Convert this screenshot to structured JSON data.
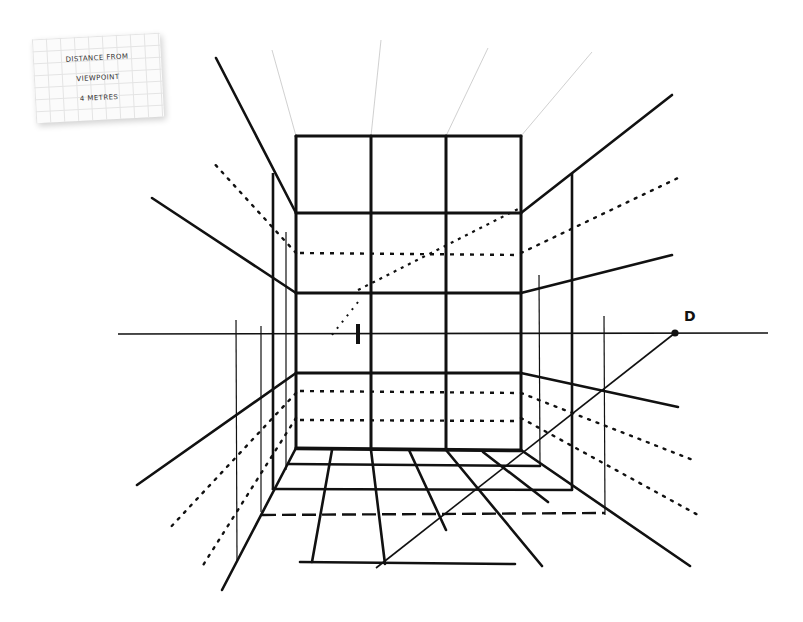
{
  "note_card": {
    "lines": [
      "DISTANCE FROM",
      "VIEWPOINT",
      "4 METRES"
    ]
  },
  "labels": {
    "distance_point": "D"
  },
  "drawing": {
    "type": "one-point perspective room grid",
    "horizon_y": 334,
    "vanishing_point": [
      358,
      335
    ],
    "distance_point": [
      675,
      333
    ],
    "back_wall": {
      "x": [
        296,
        371,
        446,
        521
      ],
      "y": [
        136,
        213,
        293,
        373,
        448
      ]
    },
    "ink_color": "#111111",
    "construction_color": "#bbbbbb"
  }
}
